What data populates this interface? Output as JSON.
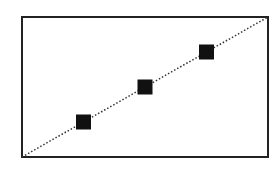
{
  "chart_data": {
    "type": "scatter",
    "title": "",
    "xlabel": "",
    "ylabel": "",
    "xlim": [
      0,
      1
    ],
    "ylim": [
      0,
      1
    ],
    "grid": false,
    "legend": null,
    "series": [
      {
        "name": "points",
        "marker": "square",
        "color": "#111111",
        "x": [
          0.25,
          0.5,
          0.75
        ],
        "y": [
          0.25,
          0.5,
          0.75
        ]
      },
      {
        "name": "reference line",
        "style": "dotted",
        "color": "#333333",
        "x": [
          0,
          1
        ],
        "y": [
          0,
          1
        ]
      }
    ]
  },
  "colors": {
    "frame": "#222222",
    "marker": "#111111",
    "line": "#333333",
    "background": "#ffffff"
  }
}
